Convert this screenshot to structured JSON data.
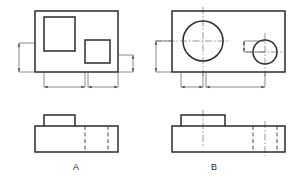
{
  "sheet": {
    "title": "Orthographic Views A and B",
    "background_color": "#ffffff",
    "line_color": "#2b2b2b",
    "centerline_color": "#6e6e6e",
    "dimension_color": "#5a5a5a",
    "hidden_line_color": "#4a4a4a",
    "width": 300,
    "height": 178
  },
  "views": [
    {
      "id": "A",
      "label": "A",
      "label_position": {
        "x": 76,
        "y": 170
      },
      "top_view": {
        "name": "top-view-a",
        "outline": {
          "x": 35,
          "y": 11,
          "width": 83,
          "height": 61
        },
        "features": [
          {
            "name": "large-rectangular-boss",
            "shape": "rectangle",
            "x": 44,
            "y": 17,
            "width": 31,
            "height": 34
          },
          {
            "name": "small-square-boss",
            "shape": "rectangle",
            "x": 85,
            "y": 40,
            "width": 25,
            "height": 23
          }
        ]
      },
      "front_view": {
        "name": "front-view-a",
        "outline": {
          "x": 35,
          "y": 126,
          "width": 83,
          "height": 26
        },
        "boss": {
          "x": 44,
          "y": 115,
          "width": 31,
          "height": 11
        },
        "hidden_lines": [
          {
            "x": 85,
            "y1": 126,
            "y2": 152
          },
          {
            "x": 108,
            "y1": 126,
            "y2": 152
          }
        ],
        "center_lines": []
      },
      "dimensions": [
        {
          "name": "dim-vertical-left-a",
          "orientation": "vertical",
          "x": 19,
          "y1": 43,
          "y2": 72,
          "extension_from": 35
        },
        {
          "name": "dim-vertical-right-a",
          "orientation": "vertical",
          "x": 133,
          "y1": 55,
          "y2": 72,
          "extension_from": 118
        },
        {
          "name": "dim-horizontal-left-a",
          "orientation": "horizontal",
          "y": 87,
          "x1": 44,
          "x2": 85,
          "extension_from": 72
        },
        {
          "name": "dim-horizontal-right-a",
          "orientation": "horizontal",
          "y": 87,
          "x1": 88,
          "x2": 118,
          "extension_from": 72
        }
      ]
    },
    {
      "id": "B",
      "label": "B",
      "label_position": {
        "x": 214,
        "y": 170
      },
      "top_view": {
        "name": "top-view-b",
        "outline": {
          "x": 172,
          "y": 11,
          "width": 113,
          "height": 61
        },
        "features": [
          {
            "name": "large-circular-boss",
            "shape": "circle",
            "cx": 203,
            "cy": 41,
            "r": 20
          },
          {
            "name": "small-circular-boss",
            "shape": "circle",
            "cx": 265,
            "cy": 52,
            "r": 12
          }
        ],
        "center_lines": [
          {
            "name": "centerline-large-circle-horizontal",
            "orientation": "horizontal",
            "y": 41,
            "x1": 155,
            "x2": 230
          },
          {
            "name": "centerline-large-circle-vertical",
            "orientation": "vertical",
            "x": 203,
            "y1": 7,
            "y2": 76
          },
          {
            "name": "centerline-small-circle-horizontal",
            "orientation": "horizontal",
            "y": 52,
            "x1": 246,
            "x2": 284
          },
          {
            "name": "centerline-small-circle-vertical",
            "orientation": "vertical",
            "x": 265,
            "y1": 33,
            "y2": 76
          }
        ]
      },
      "front_view": {
        "name": "front-view-b",
        "outline": {
          "x": 172,
          "y": 126,
          "width": 113,
          "height": 26
        },
        "boss": {
          "x": 181,
          "y": 115,
          "width": 44,
          "height": 11
        },
        "hidden_lines": [
          {
            "x": 253,
            "y1": 126,
            "y2": 152
          },
          {
            "x": 277,
            "y1": 126,
            "y2": 152
          }
        ],
        "center_lines": [
          {
            "name": "centerline-front-boss-b",
            "orientation": "vertical",
            "x": 203,
            "y1": 110,
            "y2": 148
          },
          {
            "name": "centerline-front-hole-b",
            "orientation": "vertical",
            "x": 265,
            "y1": 121,
            "y2": 156
          }
        ]
      },
      "dimensions": [
        {
          "name": "dim-vertical-left-b",
          "orientation": "vertical",
          "x": 156,
          "y1": 41,
          "y2": 72,
          "extension_from": 172
        },
        {
          "name": "dim-vertical-right-b",
          "orientation": "vertical",
          "x": 244,
          "y1": 41,
          "y2": 52,
          "extension_from": 265
        },
        {
          "name": "dim-horizontal-left-b",
          "orientation": "horizontal",
          "y": 87,
          "x1": 181,
          "x2": 203,
          "extension_from": 72
        },
        {
          "name": "dim-horizontal-right-b",
          "orientation": "horizontal",
          "y": 87,
          "x1": 206,
          "x2": 265,
          "extension_from": 72
        }
      ]
    }
  ]
}
